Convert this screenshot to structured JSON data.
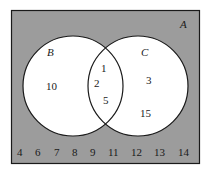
{
  "diagram": {
    "type": "venn",
    "universal_set": {
      "label": "A",
      "elements_outside": [
        "4",
        "6",
        "7",
        "8",
        "9",
        "11",
        "12",
        "13",
        "14"
      ]
    },
    "sets": [
      {
        "label": "B",
        "only": [
          "10"
        ]
      },
      {
        "label": "C",
        "only": [
          "3",
          "15"
        ]
      }
    ],
    "intersection": [
      "1",
      "2",
      "5"
    ],
    "colors": {
      "background": "#9c9c9c",
      "circle_fill": "#ffffff",
      "stroke": "#1a1a1a"
    }
  },
  "labels": {
    "A": "A",
    "B": "B",
    "C": "C",
    "b_only_0": "10",
    "c_only_0": "3",
    "c_only_1": "15",
    "int_0": "1",
    "int_1": "2",
    "int_2": "5",
    "out": [
      "4",
      "6",
      "7",
      "8",
      "9",
      "11",
      "12",
      "13",
      "14"
    ]
  }
}
